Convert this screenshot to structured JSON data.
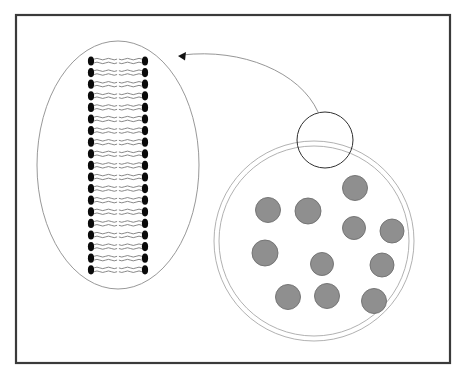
{
  "figure": {
    "width": 466,
    "height": 383,
    "background_color": "#ffffff"
  },
  "frame": {
    "name": "figure-border",
    "x": 16,
    "y": 15,
    "width": 434,
    "height": 348,
    "stroke_color": "#3a3a3a",
    "stroke_width": 2.2,
    "fill": "none"
  },
  "magnified_membrane": {
    "label": "magnified lipid bilayer inset",
    "outline": {
      "shape": "ellipse",
      "cx": 118,
      "cy": 165,
      "rx": 81,
      "ry": 124,
      "stroke_color": "#8c8c8c",
      "stroke_width": 0.9,
      "fill": "none"
    },
    "bilayer": {
      "label": "phospholipid bilayer",
      "leaflet_count": 2,
      "lipid_rows": 19,
      "row_top_y": 61,
      "row_spacing": 11.6,
      "head": {
        "label": "phospholipid head group",
        "shape": "ellipse",
        "rx": 3.1,
        "ry": 4.6,
        "fill_color": "#0a0a0a",
        "left_cx": 91,
        "right_cx": 145
      },
      "tail": {
        "label": "hydrophobic fatty acid tail",
        "tails_per_head": 2,
        "length": 23,
        "stroke_color": "#6a6a6a",
        "stroke_width": 0.8,
        "wave_amplitude": 1.5,
        "wave_count": 4
      },
      "midline_gap": 8
    }
  },
  "vesicle": {
    "label": "vesicle with secretory granules",
    "outer_wall": {
      "shape": "circle",
      "cx": 314,
      "cy": 241,
      "r": 100,
      "stroke_color": "#a8a8a8",
      "stroke_width": 0.9,
      "fill": "none"
    },
    "inner_wall": {
      "shape": "circle",
      "cx": 314,
      "cy": 241,
      "r": 95,
      "stroke_color": "#a8a8a8",
      "stroke_width": 0.9,
      "fill": "none"
    },
    "granule_style": {
      "label": "secretory granule",
      "fill_color": "#8f8f8f",
      "stroke_color": "#6e6e6e",
      "stroke_width": 0.9
    },
    "granules": [
      {
        "id": 1,
        "cx": 268,
        "cy": 210,
        "r": 12.5
      },
      {
        "id": 2,
        "cx": 308,
        "cy": 211,
        "r": 13.0
      },
      {
        "id": 3,
        "cx": 355,
        "cy": 188,
        "r": 12.5
      },
      {
        "id": 4,
        "cx": 354,
        "cy": 228,
        "r": 11.5
      },
      {
        "id": 5,
        "cx": 392,
        "cy": 231,
        "r": 12.0
      },
      {
        "id": 6,
        "cx": 265,
        "cy": 253,
        "r": 13.0
      },
      {
        "id": 7,
        "cx": 322,
        "cy": 264,
        "r": 11.5
      },
      {
        "id": 8,
        "cx": 382,
        "cy": 265,
        "r": 12.0
      },
      {
        "id": 9,
        "cx": 288,
        "cy": 297,
        "r": 12.5
      },
      {
        "id": 10,
        "cx": 327,
        "cy": 296,
        "r": 12.5
      },
      {
        "id": 11,
        "cx": 374,
        "cy": 301,
        "r": 12.5
      }
    ],
    "granule_count": 11
  },
  "magnifier": {
    "label": "magnification region marker on vesicle wall",
    "shape": "circle",
    "cx": 325,
    "cy": 140,
    "r": 28,
    "stroke_color": "#2f2f2f",
    "stroke_width": 1.0,
    "fill": "none"
  },
  "callout_arrow": {
    "label": "callout arrow from magnifier to magnified membrane inset",
    "path": "M 318,112 C 300,72 242,48 182,55",
    "stroke_color": "#8a8a8a",
    "stroke_width": 0.9,
    "arrowhead": {
      "tip_x": 178,
      "tip_y": 56,
      "size": 5,
      "fill_color": "#121212"
    }
  }
}
